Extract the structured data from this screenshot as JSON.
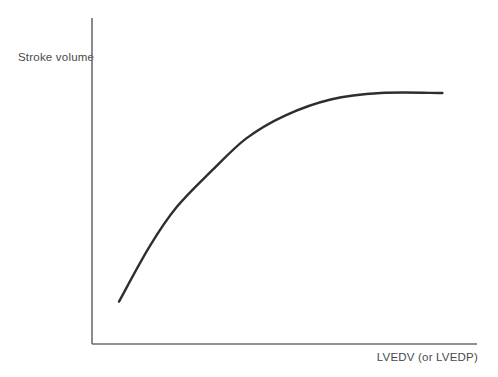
{
  "chart_data": {
    "type": "line",
    "title": "",
    "xlabel": "LVEDV (or LVEDP)",
    "ylabel": "Stroke volume",
    "axis_ticks": "none",
    "grid": false,
    "legend": "none",
    "xlim": [
      0,
      100
    ],
    "ylim": [
      0,
      100
    ],
    "note": "Qualitative Frank-Starling relationship; axes have no numeric scale. Values are relative units (0-100).",
    "series": [
      {
        "name": "stroke-volume-vs-preload-curve",
        "x": [
          7,
          15,
          22,
          31,
          40,
          50,
          62,
          75,
          91
        ],
        "y": [
          13,
          30,
          42,
          53,
          63,
          70,
          75,
          77,
          77
        ]
      }
    ],
    "colors": {
      "curve": "#2e2e2e",
      "axis": "#6e6e6e",
      "text": "#4a4a4a",
      "background": "#ffffff"
    }
  }
}
